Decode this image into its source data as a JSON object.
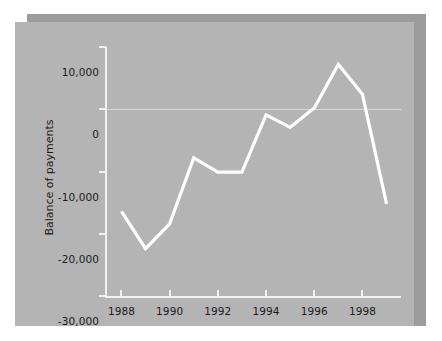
{
  "figure": {
    "panel_color": "#b4b4b4",
    "shadow_color": "#9c9c9c",
    "page_background": "#ffffff",
    "line_color": "#ffffff",
    "axis_color": "#f2f2f2",
    "text_color": "#1b1b1b"
  },
  "chart_data": {
    "type": "line",
    "title": "",
    "xlabel": "",
    "ylabel": "Balance of payments",
    "x": [
      1988,
      1989,
      1990,
      1991,
      1992,
      1993,
      1994,
      1995,
      1996,
      1997,
      1998,
      1999
    ],
    "series": [
      {
        "name": "Balance of payments",
        "values": [
          -16400,
          -22400,
          -18400,
          -7800,
          -10100,
          -10100,
          -900,
          -2900,
          200,
          7200,
          2400,
          -15200
        ]
      }
    ],
    "xlim": [
      1987.4,
      1999.6
    ],
    "ylim": [
      -30000,
      10000
    ],
    "ytick_labels": [
      "10,000",
      "0",
      "-10,000",
      "-20,000",
      "-30,000"
    ],
    "ytick_values": [
      10000,
      0,
      -10000,
      -20000,
      -30000
    ],
    "xtick_labels": [
      "1988",
      "1990",
      "1992",
      "1994",
      "1996",
      "1998"
    ],
    "xtick_values": [
      1988,
      1990,
      1992,
      1994,
      1996,
      1998
    ],
    "grid": "zero-line-only",
    "legend": "none",
    "legend_position": "none"
  }
}
